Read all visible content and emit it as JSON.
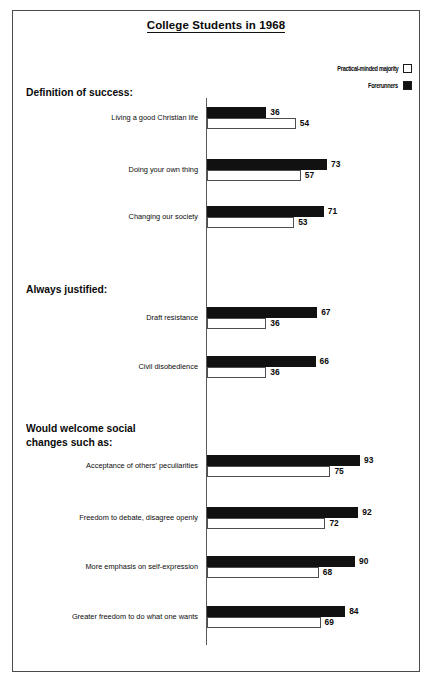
{
  "figure": {
    "title": "College Students in 1968",
    "border_color": "#4a4a4a",
    "background": "#ffffff"
  },
  "legend": {
    "position": "top-right",
    "entries": [
      {
        "label": "Practical-minded majority",
        "swatch": "legend-swatch-open-square",
        "style": "light",
        "color": "#ffffff"
      },
      {
        "label": "Forerunners",
        "swatch": "legend-swatch-filled-square",
        "style": "dark",
        "color": "#111111"
      }
    ]
  },
  "sections": [
    {
      "heading": "Definition of success:"
    },
    {
      "heading": "Always justified:"
    },
    {
      "heading": "Would welcome social\nchanges such as:"
    }
  ],
  "chart_data": {
    "type": "bar",
    "orientation": "horizontal",
    "title": "College Students in 1968",
    "xlabel": "",
    "ylabel": "",
    "xlim": [
      0,
      100
    ],
    "grid": false,
    "legend_position": "top-right",
    "series": [
      {
        "name": "Forerunners",
        "color": "#111111",
        "values": [
          36,
          73,
          71,
          67,
          66,
          93,
          92,
          90,
          84
        ]
      },
      {
        "name": "Practical-minded majority",
        "color": "#ffffff",
        "values": [
          54,
          57,
          53,
          36,
          36,
          75,
          72,
          68,
          69
        ]
      }
    ],
    "categories": [
      "Living a good Christian life",
      "Doing your own thing",
      "Changing our society",
      "Draft resistance",
      "Civil disobedience",
      "Acceptance of others' peculiarities",
      "Freedom to debate, disagree openly",
      "More emphasis on self-expression",
      "Greater freedom to do what one wants"
    ],
    "groups": [
      {
        "heading": "Definition of success:",
        "rows": [
          {
            "label": "Living a good Christian life",
            "forerunners": 36,
            "majority": 54
          },
          {
            "label": "Doing your own thing",
            "forerunners": 73,
            "majority": 57
          },
          {
            "label": "Changing our society",
            "forerunners": 71,
            "majority": 53
          }
        ]
      },
      {
        "heading": "Always justified:",
        "rows": [
          {
            "label": "Draft resistance",
            "forerunners": 67,
            "majority": 36
          },
          {
            "label": "Civil disobedience",
            "forerunners": 66,
            "majority": 36
          }
        ]
      },
      {
        "heading": "Would welcome social changes such as:",
        "rows": [
          {
            "label": "Acceptance of others' peculiarities",
            "forerunners": 93,
            "majority": 75
          },
          {
            "label": "Freedom to debate, disagree openly",
            "forerunners": 92,
            "majority": 72
          },
          {
            "label": "More emphasis on self-expression",
            "forerunners": 90,
            "majority": 68
          },
          {
            "label": "Greater freedom to do what one wants",
            "forerunners": 84,
            "majority": 69
          }
        ]
      }
    ]
  },
  "layout": {
    "axis_x": 193,
    "px_per_unit": 1.645,
    "rows": [
      {
        "top": 96,
        "section": 0
      },
      {
        "top": 148,
        "section": 0
      },
      {
        "top": 195,
        "section": 0
      },
      {
        "top": 296,
        "section": 1
      },
      {
        "top": 345,
        "section": 1
      },
      {
        "top": 444,
        "section": 2
      },
      {
        "top": 496,
        "section": 2
      },
      {
        "top": 545,
        "section": 2
      },
      {
        "top": 595,
        "section": 2
      }
    ],
    "section_heads": [
      {
        "top": 75
      },
      {
        "top": 272
      },
      {
        "top": 411
      }
    ]
  }
}
